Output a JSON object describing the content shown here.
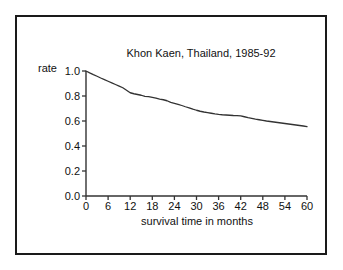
{
  "figure": {
    "background": "#ffffff",
    "frame_color": "#1a1a1a",
    "line_color": "#333333"
  },
  "chart_data": {
    "type": "line",
    "title": "Khon Kaen, Thailand, 1985-92",
    "xlabel": "survival time in months",
    "ylabel": "rate",
    "xlim": [
      0,
      60
    ],
    "ylim": [
      0.0,
      1.0
    ],
    "grid": false,
    "legend": "none",
    "xticks": [
      0,
      6,
      12,
      18,
      24,
      30,
      36,
      42,
      48,
      54,
      60
    ],
    "xtick_labels": [
      "0",
      "6",
      "12",
      "18",
      "24",
      "30",
      "36",
      "42",
      "48",
      "54",
      "60"
    ],
    "yticks": [
      0.0,
      0.2,
      0.4,
      0.6,
      0.8,
      1.0
    ],
    "ytick_labels": [
      "0.0",
      "0.2",
      "0.4",
      "0.6",
      "0.8",
      "1.0"
    ],
    "series": [
      {
        "name": "survival rate",
        "x": [
          0,
          1,
          2,
          3,
          4,
          5,
          6,
          7,
          8,
          9,
          10,
          11,
          12,
          13,
          14,
          15,
          16,
          17,
          18,
          19,
          20,
          21,
          22,
          23,
          24,
          25,
          26,
          27,
          28,
          29,
          30,
          31,
          32,
          33,
          34,
          35,
          36,
          37,
          38,
          39,
          40,
          41,
          42,
          43,
          44,
          45,
          46,
          47,
          48,
          49,
          50,
          51,
          52,
          53,
          54,
          55,
          56,
          57,
          58,
          59,
          60
        ],
        "values": [
          1.0,
          0.985,
          0.971,
          0.958,
          0.944,
          0.931,
          0.918,
          0.905,
          0.892,
          0.879,
          0.866,
          0.846,
          0.826,
          0.818,
          0.812,
          0.806,
          0.797,
          0.795,
          0.789,
          0.783,
          0.775,
          0.77,
          0.762,
          0.749,
          0.741,
          0.733,
          0.724,
          0.714,
          0.705,
          0.695,
          0.686,
          0.678,
          0.672,
          0.667,
          0.662,
          0.657,
          0.653,
          0.65,
          0.648,
          0.646,
          0.644,
          0.643,
          0.641,
          0.634,
          0.627,
          0.621,
          0.615,
          0.61,
          0.605,
          0.6,
          0.596,
          0.592,
          0.588,
          0.584,
          0.58,
          0.576,
          0.572,
          0.568,
          0.564,
          0.56,
          0.555
        ]
      }
    ]
  }
}
